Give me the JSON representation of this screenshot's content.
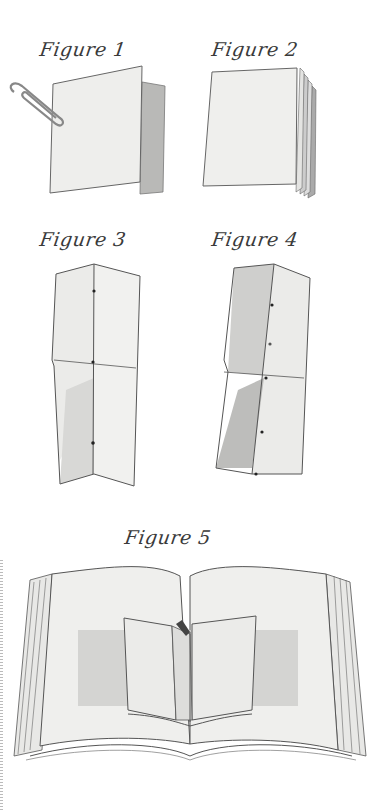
{
  "figures": [
    {
      "id": 1,
      "caption": "Figure 1",
      "subject": "folded sheet of paper held by paperclip",
      "icon": "paperclip-icon"
    },
    {
      "id": 2,
      "caption": "Figure 2",
      "subject": "stack of folded sheets"
    },
    {
      "id": 3,
      "caption": "Figure 3",
      "subject": "long folded strip with center crease and stitch holes"
    },
    {
      "id": 4,
      "caption": "Figure 4",
      "subject": "shaded folded strip with stitch holes"
    },
    {
      "id": 5,
      "caption": "Figure 5",
      "subject": "small folded booklet pasted into an open book"
    }
  ],
  "colors": {
    "background": "#ffffff",
    "paper": "#efefed",
    "paper_shade": "#d9d9d7",
    "shadow": "#b8b8b6",
    "ink": "#4a4a4a"
  }
}
